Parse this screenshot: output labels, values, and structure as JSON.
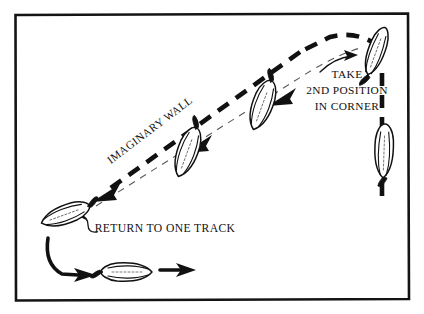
{
  "diagram": {
    "background_color": "#ffffff",
    "ink_color": "#111111",
    "frame": {
      "name": "diagram-border",
      "x": 14,
      "y": 13,
      "width": 396,
      "height": 287,
      "stroke_color": "#141414"
    },
    "labels": [
      {
        "id": "take-2nd-position",
        "lines": [
          "TAKE",
          "2ND POSITION",
          "IN CORNER"
        ],
        "x": 347,
        "y": 74,
        "rotation": 0,
        "align": "middle"
      },
      {
        "id": "imaginary-wall",
        "lines": [
          "IMAGINARY WALL"
        ],
        "x": 152,
        "y": 133,
        "rotation": -37,
        "align": "middle"
      },
      {
        "id": "return-to-one-track",
        "lines": [
          "RETURN TO ONE TRACK"
        ],
        "x": 165,
        "y": 228,
        "rotation": 0,
        "align": "middle"
      }
    ],
    "track_path": {
      "name": "thick-dashed-track",
      "description": "Dashed travel path running from lower-left diagonally up to the top-right corner then down the right side",
      "dash_pattern": "13 9",
      "stroke_width": 4.6
    },
    "wall_line": {
      "name": "imaginary-wall-line",
      "description": "Thin dashed line parallel to and inside the track representing the imaginary wall",
      "dash_pattern": "7 6",
      "stroke_width": 1.1,
      "stroke_color": "#5a5a5a"
    },
    "arrows": [
      {
        "id": "track-arrow-upper",
        "direction": "down-left",
        "x": 280,
        "y": 98
      },
      {
        "id": "track-arrow-middle",
        "direction": "down-left",
        "x": 196,
        "y": 145
      },
      {
        "id": "track-arrow-lower",
        "direction": "down-left",
        "x": 104,
        "y": 194
      },
      {
        "id": "curved-arrow-to-corner-horse",
        "direction": "up-right",
        "x": 336,
        "y": 63
      },
      {
        "id": "curved-arrow-to-left-horse",
        "direction": "left",
        "x": 92,
        "y": 220
      },
      {
        "id": "bottom-arrow-left",
        "direction": "right",
        "x": 86,
        "y": 272
      },
      {
        "id": "bottom-arrow-right",
        "direction": "right",
        "x": 166,
        "y": 270
      }
    ],
    "horses": [
      {
        "id": "horse-corner",
        "x": 376,
        "y": 52,
        "angle": 205,
        "note": "second position in corner"
      },
      {
        "id": "horse-right-rail",
        "x": 384,
        "y": 152,
        "angle": 182,
        "note": "on the rail, straight"
      },
      {
        "id": "horse-upper-diagonal",
        "x": 262,
        "y": 106,
        "angle": 200,
        "note": "two tracks off the wall"
      },
      {
        "id": "horse-lower-diagonal",
        "x": 187,
        "y": 153,
        "angle": 200,
        "note": "two tracks off the wall"
      },
      {
        "id": "horse-return-left",
        "x": 64,
        "y": 215,
        "angle": 250,
        "note": "returning to one track"
      },
      {
        "id": "horse-bottom",
        "x": 128,
        "y": 272,
        "angle": 90,
        "note": "back on one track"
      }
    ]
  }
}
